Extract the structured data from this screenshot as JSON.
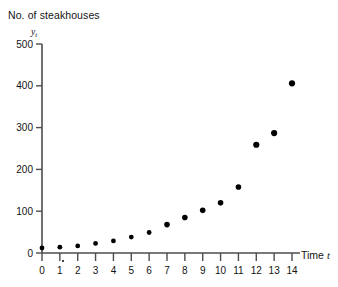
{
  "chart_data": {
    "type": "scatter",
    "title": "No. of steakhouses",
    "xlabel": "Time t",
    "ylabel": "y_t",
    "x": [
      0,
      1,
      2,
      3,
      4,
      5,
      6,
      7,
      8,
      9,
      10,
      11,
      12,
      13,
      14
    ],
    "values": [
      12,
      14,
      17,
      23,
      29,
      38,
      49,
      68,
      85,
      102,
      120,
      158,
      259,
      287,
      406
    ],
    "xtick_labels": [
      "0",
      "1",
      "2",
      "3",
      "4",
      "5",
      "6",
      "7",
      "8",
      "9",
      "10",
      "11",
      "12",
      "13",
      "14"
    ],
    "ytick_labels": [
      "0",
      "100",
      "200",
      "300",
      "400",
      "500"
    ],
    "ytick_values": [
      0,
      100,
      200,
      300,
      400,
      500
    ],
    "xlim": [
      0,
      14
    ],
    "ylim": [
      0,
      500
    ],
    "grid": false,
    "legend": false,
    "marker": "filled-circle",
    "marker_color": "#000000",
    "axis_color": "#4d4d4d"
  },
  "labels": {
    "title": "No. of steakhouses",
    "y_axis_symbol": "y",
    "y_axis_subscript": "t",
    "x_axis_prefix": "Time ",
    "x_axis_symbol": "t"
  }
}
